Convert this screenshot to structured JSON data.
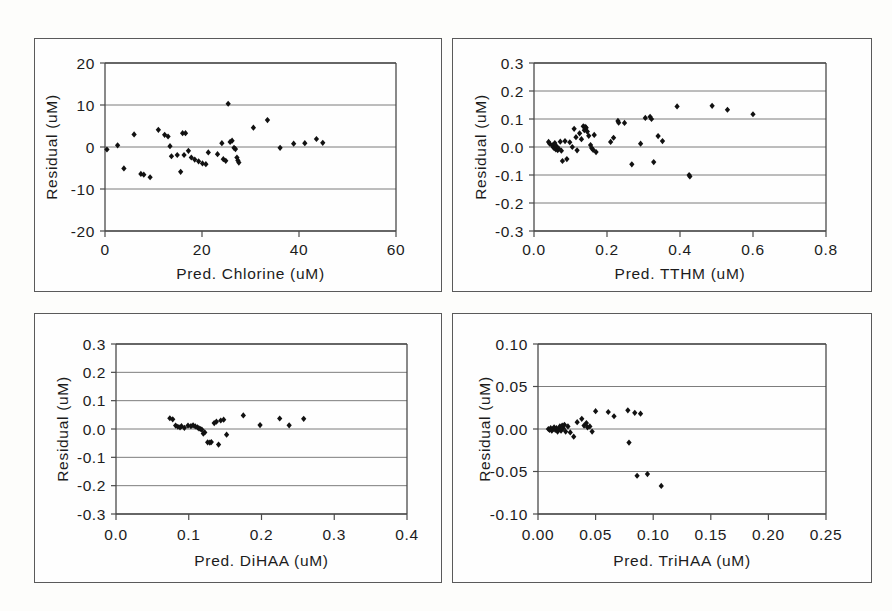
{
  "figure": {
    "title": "",
    "background_color": "#fdfdfb",
    "panel_border_color": "#5a5a5a",
    "marker_color": "#111111",
    "panel_count": 4
  },
  "chart_data": [
    {
      "id": "chlorine",
      "type": "scatter",
      "title": "",
      "xlabel": "Pred. Chlorine (uM)",
      "ylabel": "Residual (uM)",
      "xlim": [
        0,
        60
      ],
      "ylim": [
        -20,
        20
      ],
      "xticks": [
        0,
        20,
        40,
        60
      ],
      "xtick_labels": [
        "0",
        "20",
        "40",
        "60"
      ],
      "yticks": [
        -20,
        -10,
        0,
        10,
        20
      ],
      "ytick_labels": [
        "-20",
        "-10",
        "0",
        "10",
        "20"
      ],
      "grid": true,
      "legend": false,
      "marker": "diamond",
      "points": [
        [
          0.4,
          -0.6
        ],
        [
          2.6,
          0.4
        ],
        [
          3.9,
          -5.1
        ],
        [
          6.0,
          3.0
        ],
        [
          7.4,
          -6.4
        ],
        [
          8.0,
          -6.6
        ],
        [
          9.3,
          -7.2
        ],
        [
          11.0,
          4.1
        ],
        [
          12.3,
          2.9
        ],
        [
          13.0,
          2.5
        ],
        [
          13.4,
          0.2
        ],
        [
          13.7,
          -2.2
        ],
        [
          14.9,
          -1.9
        ],
        [
          15.6,
          -5.9
        ],
        [
          16.0,
          3.3
        ],
        [
          16.3,
          -1.9
        ],
        [
          16.6,
          3.3
        ],
        [
          17.2,
          -0.9
        ],
        [
          17.8,
          -2.5
        ],
        [
          18.5,
          -3.0
        ],
        [
          19.3,
          -3.4
        ],
        [
          20.1,
          -3.9
        ],
        [
          20.8,
          -4.1
        ],
        [
          21.3,
          -1.3
        ],
        [
          23.2,
          -1.7
        ],
        [
          24.1,
          0.9
        ],
        [
          24.4,
          -2.9
        ],
        [
          24.9,
          -3.3
        ],
        [
          25.4,
          10.3
        ],
        [
          25.8,
          1.2
        ],
        [
          26.2,
          1.5
        ],
        [
          26.6,
          -0.2
        ],
        [
          26.9,
          -0.5
        ],
        [
          27.2,
          -2.5
        ],
        [
          27.4,
          -3.2
        ],
        [
          27.6,
          -3.7
        ],
        [
          30.6,
          4.6
        ],
        [
          33.5,
          6.4
        ],
        [
          36.1,
          -0.2
        ],
        [
          38.9,
          0.8
        ],
        [
          41.2,
          0.9
        ],
        [
          43.6,
          1.9
        ],
        [
          44.9,
          1.0
        ]
      ]
    },
    {
      "id": "tthm",
      "type": "scatter",
      "title": "",
      "xlabel": "Pred. TTHM (uM)",
      "ylabel": "Residual (uM)",
      "xlim": [
        0.0,
        0.8
      ],
      "ylim": [
        -0.3,
        0.3
      ],
      "xticks": [
        0.0,
        0.2,
        0.4,
        0.6,
        0.8
      ],
      "xtick_labels": [
        "0.0",
        "0.2",
        "0.4",
        "0.6",
        "0.8"
      ],
      "yticks": [
        -0.3,
        -0.2,
        -0.1,
        0.0,
        0.1,
        0.2,
        0.3
      ],
      "ytick_labels": [
        "-0.3",
        "-0.2",
        "-0.1",
        "0.0",
        "0.1",
        "0.2",
        "0.3"
      ],
      "grid": true,
      "legend": false,
      "marker": "diamond",
      "points": [
        [
          0.04,
          0.018
        ],
        [
          0.043,
          0.012
        ],
        [
          0.05,
          0.006
        ],
        [
          0.052,
          0.001
        ],
        [
          0.055,
          -0.004
        ],
        [
          0.057,
          0.014
        ],
        [
          0.06,
          -0.009
        ],
        [
          0.062,
          0.002
        ],
        [
          0.065,
          -0.011
        ],
        [
          0.068,
          -0.006
        ],
        [
          0.072,
          0.019
        ],
        [
          0.075,
          -0.013
        ],
        [
          0.078,
          -0.05
        ],
        [
          0.085,
          0.021
        ],
        [
          0.09,
          -0.043
        ],
        [
          0.098,
          0.017
        ],
        [
          0.105,
          0.0
        ],
        [
          0.11,
          0.065
        ],
        [
          0.115,
          0.035
        ],
        [
          0.118,
          -0.012
        ],
        [
          0.125,
          0.049
        ],
        [
          0.13,
          0.028
        ],
        [
          0.135,
          0.074
        ],
        [
          0.138,
          0.06
        ],
        [
          0.14,
          0.072
        ],
        [
          0.143,
          0.069
        ],
        [
          0.146,
          0.055
        ],
        [
          0.15,
          0.04
        ],
        [
          0.155,
          0.007
        ],
        [
          0.158,
          -0.004
        ],
        [
          0.162,
          -0.01
        ],
        [
          0.165,
          0.043
        ],
        [
          0.17,
          -0.018
        ],
        [
          0.21,
          0.018
        ],
        [
          0.218,
          0.033
        ],
        [
          0.23,
          0.093
        ],
        [
          0.232,
          0.087
        ],
        [
          0.248,
          0.086
        ],
        [
          0.268,
          -0.062
        ],
        [
          0.292,
          0.012
        ],
        [
          0.305,
          0.104
        ],
        [
          0.318,
          0.108
        ],
        [
          0.322,
          0.1
        ],
        [
          0.328,
          -0.054
        ],
        [
          0.34,
          0.039
        ],
        [
          0.352,
          0.021
        ],
        [
          0.392,
          0.145
        ],
        [
          0.425,
          -0.1
        ],
        [
          0.427,
          -0.105
        ],
        [
          0.488,
          0.147
        ],
        [
          0.53,
          0.133
        ],
        [
          0.6,
          0.117
        ]
      ]
    },
    {
      "id": "dihaa",
      "type": "scatter",
      "title": "",
      "xlabel": "Pred. DiHAA (uM)",
      "ylabel": "Residual (uM)",
      "xlim": [
        0.0,
        0.4
      ],
      "ylim": [
        -0.3,
        0.3
      ],
      "xticks": [
        0.0,
        0.1,
        0.2,
        0.3,
        0.4
      ],
      "xtick_labels": [
        "0.0",
        "0.1",
        "0.2",
        "0.3",
        "0.4"
      ],
      "yticks": [
        -0.3,
        -0.2,
        -0.1,
        0.0,
        0.1,
        0.2,
        0.3
      ],
      "ytick_labels": [
        "-0.3",
        "-0.2",
        "-0.1",
        "0.0",
        "0.1",
        "0.2",
        "0.3"
      ],
      "grid": true,
      "legend": false,
      "marker": "diamond",
      "points": [
        [
          0.074,
          0.038
        ],
        [
          0.078,
          0.034
        ],
        [
          0.082,
          0.012
        ],
        [
          0.085,
          0.008
        ],
        [
          0.088,
          0.006
        ],
        [
          0.09,
          0.01
        ],
        [
          0.094,
          0.004
        ],
        [
          0.099,
          0.012
        ],
        [
          0.103,
          0.01
        ],
        [
          0.106,
          0.013
        ],
        [
          0.109,
          0.009
        ],
        [
          0.112,
          0.006
        ],
        [
          0.114,
          0.002
        ],
        [
          0.116,
          0.0
        ],
        [
          0.118,
          -0.002
        ],
        [
          0.12,
          -0.016
        ],
        [
          0.122,
          -0.012
        ],
        [
          0.126,
          -0.047
        ],
        [
          0.129,
          -0.048
        ],
        [
          0.131,
          -0.046
        ],
        [
          0.135,
          0.021
        ],
        [
          0.138,
          0.026
        ],
        [
          0.141,
          -0.055
        ],
        [
          0.144,
          0.03
        ],
        [
          0.148,
          0.033
        ],
        [
          0.152,
          -0.02
        ],
        [
          0.175,
          0.048
        ],
        [
          0.198,
          0.014
        ],
        [
          0.225,
          0.037
        ],
        [
          0.238,
          0.013
        ],
        [
          0.258,
          0.036
        ]
      ]
    },
    {
      "id": "trihaa",
      "type": "scatter",
      "title": "",
      "xlabel": "Pred. TriHAA (uM)",
      "ylabel": "Residual (uM)",
      "xlim": [
        0.0,
        0.25
      ],
      "ylim": [
        -0.1,
        0.1
      ],
      "xticks": [
        0.0,
        0.05,
        0.1,
        0.15,
        0.2,
        0.25
      ],
      "xtick_labels": [
        "0.00",
        "0.05",
        "0.10",
        "0.15",
        "0.20",
        "0.25"
      ],
      "yticks": [
        -0.1,
        -0.05,
        0.0,
        0.05,
        0.1
      ],
      "ytick_labels": [
        "-0.10",
        "-0.05",
        "0.00",
        "0.05",
        "0.10"
      ],
      "grid": true,
      "legend": false,
      "marker": "diamond",
      "points": [
        [
          0.009,
          0.0
        ],
        [
          0.01,
          -0.001
        ],
        [
          0.011,
          0.001
        ],
        [
          0.012,
          -0.002
        ],
        [
          0.013,
          0.0
        ],
        [
          0.014,
          0.002
        ],
        [
          0.015,
          -0.001
        ],
        [
          0.016,
          0.001
        ],
        [
          0.017,
          -0.003
        ],
        [
          0.018,
          0.0
        ],
        [
          0.019,
          0.003
        ],
        [
          0.02,
          -0.002
        ],
        [
          0.021,
          0.004
        ],
        [
          0.022,
          0.001
        ],
        [
          0.023,
          0.005
        ],
        [
          0.024,
          -0.003
        ],
        [
          0.026,
          0.003
        ],
        [
          0.028,
          -0.004
        ],
        [
          0.031,
          -0.009
        ],
        [
          0.034,
          0.008
        ],
        [
          0.038,
          0.012
        ],
        [
          0.04,
          0.004
        ],
        [
          0.042,
          0.007
        ],
        [
          0.043,
          0.002
        ],
        [
          0.045,
          0.003
        ],
        [
          0.047,
          -0.003
        ],
        [
          0.05,
          0.021
        ],
        [
          0.061,
          0.02
        ],
        [
          0.066,
          0.015
        ],
        [
          0.078,
          0.022
        ],
        [
          0.079,
          -0.016
        ],
        [
          0.084,
          0.019
        ],
        [
          0.086,
          -0.055
        ],
        [
          0.089,
          0.018
        ],
        [
          0.095,
          -0.053
        ],
        [
          0.107,
          -0.067
        ]
      ]
    }
  ]
}
